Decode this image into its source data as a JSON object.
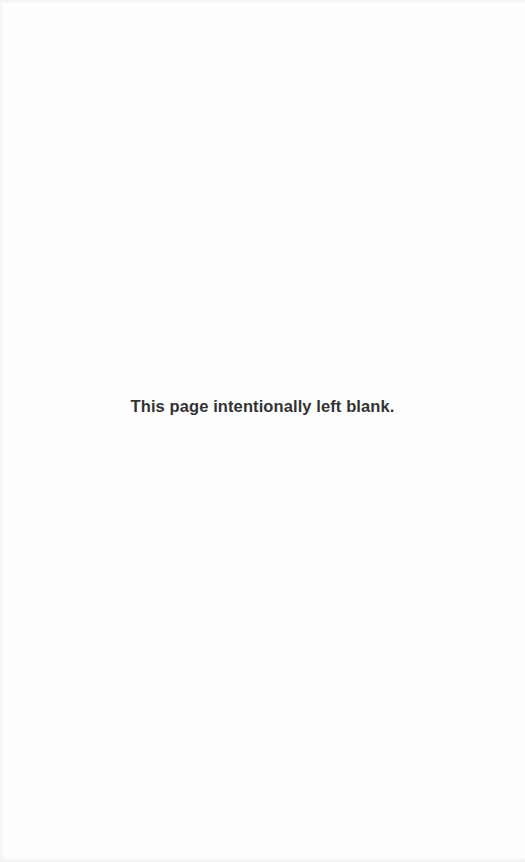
{
  "page": {
    "notice_text": "This page intentionally left blank.",
    "text_color": "#333333",
    "background_color": "#fefefe"
  }
}
